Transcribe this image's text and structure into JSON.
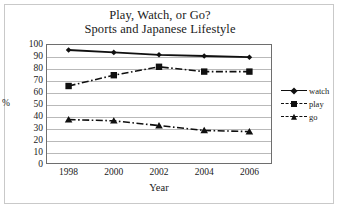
{
  "chart_data": {
    "type": "line",
    "title": "Play, Watch, or Go?",
    "subtitle": "Sports and Japanese Lifestyle",
    "xlabel": "Year",
    "ylabel": "%",
    "x": [
      1998,
      2000,
      2002,
      2004,
      2006
    ],
    "xtick_labels": [
      "1998",
      "2000",
      "2002",
      "2004",
      "2006"
    ],
    "ytick_labels": [
      "100",
      "90",
      "80",
      "70",
      "60",
      "50",
      "40",
      "30",
      "20",
      "10",
      "0"
    ],
    "ylim": [
      0,
      100
    ],
    "xlim": [
      1997,
      2007
    ],
    "grid": true,
    "legend_position": "right",
    "series": [
      {
        "name": "watch",
        "values": [
          95,
          93,
          91,
          90,
          89
        ],
        "marker": "diamond",
        "line_style": "solid",
        "color": "#101010"
      },
      {
        "name": "play",
        "values": [
          65,
          74,
          81,
          77,
          77
        ],
        "marker": "square",
        "line_style": "dash-dot",
        "color": "#101010"
      },
      {
        "name": "go",
        "values": [
          37,
          36,
          32,
          28,
          27
        ],
        "marker": "triangle",
        "line_style": "dash-dot",
        "color": "#101010"
      }
    ]
  },
  "legend": {
    "items": [
      {
        "label": "watch",
        "marker": "diamond",
        "style": "solid"
      },
      {
        "label": "play",
        "marker": "square",
        "style": "dashed"
      },
      {
        "label": "go",
        "marker": "triangle",
        "style": "dashed"
      }
    ]
  },
  "colors": {
    "ink": "#101010",
    "grid": "#b9b9b9",
    "axis": "#6e6e6e",
    "frame": "#c9c9c9",
    "background": "#ffffff"
  }
}
